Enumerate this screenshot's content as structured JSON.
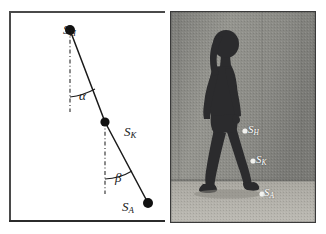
{
  "figure": {
    "panels": [
      {
        "id": "diagram",
        "kind": "stick-figure-angle-diagram"
      },
      {
        "id": "photo",
        "kind": "walking-subject-photograph"
      }
    ]
  },
  "diagram": {
    "points": [
      {
        "key": "SH",
        "symbol": "S",
        "subscript": "H",
        "x": 70,
        "y": 30
      },
      {
        "key": "SK",
        "symbol": "S",
        "subscript": "K",
        "x": 105,
        "y": 122
      },
      {
        "key": "SA",
        "symbol": "S",
        "subscript": "A",
        "x": 148,
        "y": 203
      }
    ],
    "labels": {
      "s_h": "S",
      "s_h_sub": "H",
      "s_k": "S",
      "s_k_sub": "K",
      "s_a": "S",
      "s_a_sub": "A",
      "alpha": "α",
      "beta": "β"
    },
    "angles": [
      {
        "key": "alpha",
        "glyph": "α",
        "vertex": "SH",
        "between": [
          "vertical-reference",
          "SH-SK-segment"
        ]
      },
      {
        "key": "beta",
        "glyph": "β",
        "vertex": "SK",
        "between": [
          "vertical-reference",
          "SK-SA-segment"
        ]
      }
    ],
    "reference_lines": [
      {
        "key": "vertical-through-SH",
        "style": "dash-dot",
        "from_y": 30,
        "to_y": 112
      },
      {
        "key": "vertical-through-SK",
        "style": "dash-dot",
        "from_y": 122,
        "to_y": 194
      }
    ],
    "segments": [
      {
        "key": "thigh-segment",
        "from": "SH",
        "to": "SK"
      },
      {
        "key": "shank-segment",
        "from": "SK",
        "to": "SA"
      }
    ],
    "colors": {
      "stroke": "#1a1a1a",
      "marker": "#111111",
      "frame": "#4a4a4a",
      "background": "#ffffff"
    }
  },
  "photo": {
    "labels": {
      "s_h": "S",
      "s_h_sub": "H",
      "s_k": "S",
      "s_k_sub": "K",
      "s_a": "S",
      "s_a_sub": "A"
    },
    "markers": [
      {
        "key": "SH",
        "name": "hip-marker",
        "x": 75,
        "y": 120
      },
      {
        "key": "SK",
        "name": "knee-marker",
        "x": 83,
        "y": 150
      },
      {
        "key": "SA",
        "name": "ankle-marker",
        "x": 92,
        "y": 183
      }
    ],
    "scene": {
      "subject": "person-walking-left-to-right",
      "floor_line_y": 170,
      "wall_seam_x": [
        8,
        92,
        132
      ]
    },
    "colors": {
      "wall": "#8f8f8b",
      "floor": "#b4b2ab",
      "subject": "#2a2a2c",
      "marker": "#f2f2ef",
      "label": "#ffffff"
    }
  }
}
